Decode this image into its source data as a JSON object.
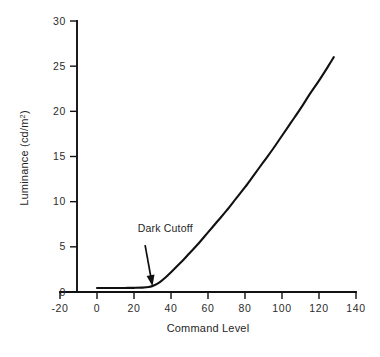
{
  "chart_data": {
    "type": "line",
    "title": "",
    "xlabel": "Command Level",
    "ylabel": "Luminance (cd/m²)",
    "ylabel_base": "Luminance (cd/m",
    "ylabel_sup": "2",
    "ylabel_close": ")",
    "xlim": [
      -20,
      140
    ],
    "ylim": [
      0,
      30
    ],
    "xticks": [
      -20,
      0,
      20,
      40,
      60,
      80,
      100,
      120,
      140
    ],
    "xtick_labels": [
      "-20",
      "0",
      "20",
      "40",
      "60",
      "80",
      "100",
      "120",
      "140"
    ],
    "yticks": [
      0,
      5,
      10,
      15,
      20,
      25,
      30
    ],
    "ytick_labels": [
      "0",
      "5",
      "10",
      "15",
      "20",
      "25",
      "30"
    ],
    "grid": false,
    "legend": false,
    "series": [
      {
        "name": "Luminance transfer curve",
        "color": "#111111",
        "x": [
          0,
          5,
          10,
          15,
          20,
          24,
          28,
          31,
          34,
          37,
          40,
          45,
          50,
          55,
          60,
          65,
          70,
          75,
          80,
          85,
          90,
          95,
          100,
          105,
          110,
          115,
          120,
          125,
          128
        ],
        "y": [
          0.45,
          0.45,
          0.45,
          0.45,
          0.46,
          0.48,
          0.55,
          0.75,
          1.1,
          1.6,
          2.2,
          3.2,
          4.3,
          5.4,
          6.6,
          7.8,
          9.0,
          10.3,
          11.6,
          13.0,
          14.4,
          15.8,
          17.3,
          18.8,
          20.3,
          21.9,
          23.4,
          25.0,
          26.0
        ]
      }
    ],
    "annotations": [
      {
        "text": "Dark Cutoff",
        "text_x": 22,
        "text_y": 6.6,
        "arrow_from_x": 26,
        "arrow_from_y": 5.2,
        "arrow_to_x": 30,
        "arrow_to_y": 0.65
      }
    ]
  },
  "axis": {
    "line_color": "#111111"
  }
}
